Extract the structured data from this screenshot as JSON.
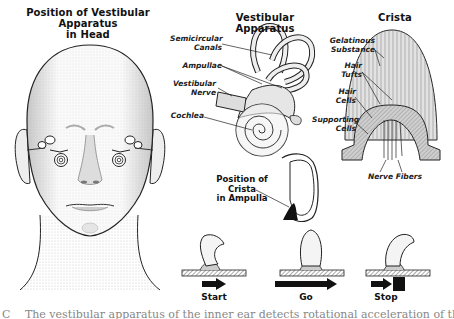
{
  "panels": {
    "head": {
      "title_line1": "Position of Vestibular Apparatus",
      "title_line2": "in Head"
    },
    "apparatus": {
      "title": "Vestibular Apparatus",
      "labels": {
        "semicircular_line1": "Semicircular",
        "semicircular_line2": "Canals",
        "ampullae": "Ampullae",
        "vestibular_line1": "Vestibular",
        "vestibular_line2": "Nerve",
        "cochlea": "Cochlea"
      }
    },
    "crista": {
      "title": "Crista",
      "labels": {
        "gelatinous_line1": "Gelatinous",
        "gelatinous_line2": "Substance",
        "hair_tufts_line1": "Hair",
        "hair_tufts_line2": "Tufts",
        "hair_cells_line1": "Hair",
        "hair_cells_line2": "Cells",
        "supporting_line1": "Supporting",
        "supporting_line2": "Cells",
        "nerve_fibers": "Nerve Fibers"
      }
    },
    "ampulla": {
      "label_line1": "Position of",
      "label_line2": "Crista",
      "label_line3": "in Ampulla"
    },
    "motion": {
      "stages": [
        {
          "label": "Start",
          "arrow": "short"
        },
        {
          "label": "Go",
          "arrow": "long"
        },
        {
          "label": "Stop",
          "arrow": "short-blocked"
        }
      ]
    }
  },
  "caption": "C  The vestibular apparatus of the inner ear detects rotational acceleration of the head",
  "colors": {
    "ink": "#111111",
    "stipple": "#9a9a9a",
    "background": "#ffffff"
  }
}
